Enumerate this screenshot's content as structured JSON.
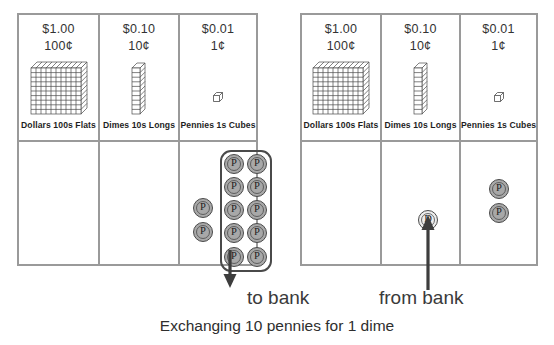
{
  "figure": {
    "caption": "Exchanging 10 pennies for 1 dime"
  },
  "panels": [
    {
      "id": "to-bank",
      "arrow_label": "to bank",
      "arrow_direction": "down",
      "columns": [
        {
          "id": "dollars",
          "amount": "$1.00",
          "cents": "100¢",
          "label": "Dollars  100s  Flats",
          "block": "flat",
          "coins": []
        },
        {
          "id": "dimes",
          "amount": "$0.10",
          "cents": "10¢",
          "label": "Dimes  10s  Longs",
          "block": "long",
          "coins": []
        },
        {
          "id": "pennies",
          "amount": "$0.01",
          "cents": "1¢",
          "label": "Pennies  1s  Cubes",
          "block": "cube",
          "coins": [
            {
              "letter": "P",
              "type": "penny",
              "x": 16,
              "y": 48,
              "grouped": false
            },
            {
              "letter": "P",
              "type": "penny",
              "x": 16,
              "y": 72,
              "grouped": false
            },
            {
              "letter": "P",
              "type": "penny",
              "x": 43,
              "y": 12,
              "grouped": true
            },
            {
              "letter": "P",
              "type": "penny",
              "x": 66,
              "y": 12,
              "grouped": true
            },
            {
              "letter": "P",
              "type": "penny",
              "x": 43,
              "y": 36,
              "grouped": true
            },
            {
              "letter": "P",
              "type": "penny",
              "x": 66,
              "y": 36,
              "grouped": true
            },
            {
              "letter": "P",
              "type": "penny",
              "x": 43,
              "y": 60,
              "grouped": true
            },
            {
              "letter": "P",
              "type": "penny",
              "x": 66,
              "y": 60,
              "grouped": true
            },
            {
              "letter": "P",
              "type": "penny",
              "x": 43,
              "y": 84,
              "grouped": true
            },
            {
              "letter": "P",
              "type": "penny",
              "x": 66,
              "y": 84,
              "grouped": true
            },
            {
              "letter": "P",
              "type": "penny",
              "x": 43,
              "y": 108,
              "grouped": true
            },
            {
              "letter": "P",
              "type": "penny",
              "x": 66,
              "y": 108,
              "grouped": true
            }
          ],
          "group_count": 10
        }
      ]
    },
    {
      "id": "from-bank",
      "arrow_label": "from bank",
      "arrow_direction": "up",
      "columns": [
        {
          "id": "dollars",
          "amount": "$1.00",
          "cents": "100¢",
          "label": "Dollars  100s  Flats",
          "block": "flat",
          "coins": []
        },
        {
          "id": "dimes",
          "amount": "$0.10",
          "cents": "10¢",
          "label": "Dimes  10s  Longs",
          "block": "long",
          "coins": [
            {
              "letter": "D",
              "type": "dime",
              "x": 36,
              "y": 68,
              "grouped": false
            }
          ]
        },
        {
          "id": "pennies",
          "amount": "$0.01",
          "cents": "1¢",
          "label": "Pennies  1s  Cubes",
          "block": "cube",
          "coins": [
            {
              "letter": "P",
              "type": "penny",
              "x": 28,
              "y": 30,
              "grouped": false
            },
            {
              "letter": "P",
              "type": "penny",
              "x": 28,
              "y": 54,
              "grouped": false
            }
          ]
        }
      ]
    }
  ],
  "colors": {
    "panel_border": "#9a9a9a",
    "penny_fill": "#a8a8a8",
    "dime_fill": "#ececec",
    "coin_outline": "#4a4a4a",
    "arrow": "#3d3d3d",
    "text": "#2b2b2b",
    "block_line": "#4a4a4a"
  }
}
